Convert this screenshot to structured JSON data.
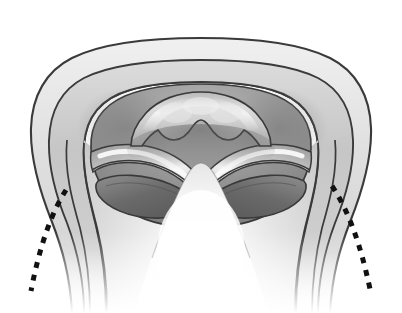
{
  "figure": {
    "title": "Axial cross-sectional anatomical illustration",
    "style": "grayscale medical line-and-tone drawing",
    "background_color": "#ffffff",
    "width": 402,
    "height": 313,
    "text_labels": [],
    "has_visible_text": false
  },
  "palette": {
    "background": "#ffffff",
    "outline_stroke": "#3a3a3a",
    "outer_rim_light": "#e2e2e2",
    "outer_rim_mid": "#cfcfcf",
    "second_band": "#c0c0c0",
    "cavity_dark": "#8f8f8f",
    "cavity_darker": "#7c7c7c",
    "lens_dark": "#6f6f6f",
    "lens_darkest": "#5c5c5c",
    "highlight_white": "#fbfbfb",
    "mid_tone": "#a8a8a8",
    "dashed_line": "#111111",
    "central_ridge_light": "#f2f2f2"
  },
  "structures": {
    "outer_capsule": {
      "name": "outer capsule rim",
      "description": "Outermost rounded trapezoidal contour, light gray band with dark outline, open and fading at the bottom",
      "fill": "#e2e2e2",
      "stroke": "#3a3a3a",
      "stroke_width": 2.2
    },
    "second_capsule": {
      "name": "inner capsule wall",
      "description": "Second concentric contour just inside the outer rim",
      "fill": "#c4c4c4",
      "stroke": "#3a3a3a",
      "stroke_width": 2.0
    },
    "cavity": {
      "name": "central cavity",
      "description": "Large darker gray cavity occupying the upper interior, shaded with gradient",
      "fill": "#949494",
      "stroke": "#3a3a3a",
      "stroke_width": 1.8
    },
    "central_arch": {
      "name": "scalloped central arch",
      "description": "Dome-topped structure at center with a wavy scalloped lower border formed by a central downward cusp flanked by two lateral cusps",
      "fill": "#c8c8c8",
      "stroke": "#3a3a3a",
      "stroke_width": 1.8,
      "cusp_count": 3
    },
    "wavy_bands_left": {
      "name": "left wavy band",
      "description": "S-shaped band sweeping from the left wall toward the midline with a bright specular highlight along its crest",
      "fill": "#bdbdbd",
      "highlight": "#fbfbfb",
      "stroke": "#3a3a3a"
    },
    "wavy_bands_right": {
      "name": "right wavy band",
      "description": "Mirror-image S-shaped band sweeping from the right wall toward the midline with a bright specular highlight",
      "fill": "#bdbdbd",
      "highlight": "#fbfbfb",
      "stroke": "#3a3a3a"
    },
    "lens_left": {
      "name": "left lens-shaped aperture",
      "description": "Dark elongated lens/oval opening on the lower left of the cavity",
      "fill": "#6b6b6b",
      "stroke": "#3a3a3a"
    },
    "lens_right": {
      "name": "right lens-shaped aperture",
      "description": "Dark elongated lens/oval opening on the lower right of the cavity",
      "fill": "#6b6b6b",
      "stroke": "#3a3a3a"
    },
    "central_ridge": {
      "name": "central ridge",
      "description": "Bright tall triangular ridge rising from the lower midline, brightest highlight of the figure, fades toward the bottom",
      "fill": "#f4f4f4",
      "stroke": "#3a3a3a"
    },
    "lower_walls": {
      "name": "lower lateral walls",
      "description": "Paired descending walls on the lower left and lower right that taper and fade into white at the bottom edge",
      "fill": "#d6d6d6",
      "stroke": "#3a3a3a"
    }
  },
  "annotations": {
    "dashed_curves": [
      {
        "name": "left dashed resection line",
        "side": "left",
        "color": "#111111",
        "stroke_width": 5,
        "dash_pattern": "6 7",
        "start": {
          "x": 64,
          "y": 192
        },
        "end": {
          "x": 28,
          "y": 292
        },
        "description": "Thick black dashed arc curving down and outward from the left lens aperture to the lower left"
      },
      {
        "name": "right dashed resection line",
        "side": "right",
        "color": "#111111",
        "stroke_width": 5,
        "dash_pattern": "6 7",
        "start": {
          "x": 330,
          "y": 186
        },
        "end": {
          "x": 372,
          "y": 290
        },
        "description": "Thick black dashed arc curving down and outward from the right lens aperture to the lower right"
      }
    ]
  }
}
